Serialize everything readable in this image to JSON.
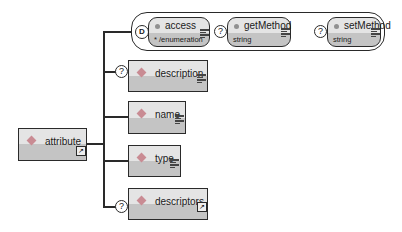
{
  "diagram": {
    "root": {
      "name": "attribute",
      "icon": "expand-icon"
    },
    "choice_group": {
      "symbol": "choice-icon",
      "attributes": [
        {
          "name": "access",
          "type": "* /enumeration",
          "optional": false,
          "icon": "lines-icon"
        },
        {
          "name": "getMethod",
          "type": "string",
          "optional": true,
          "optional_marker": "?",
          "icon": "lines-icon"
        },
        {
          "name": "setMethod",
          "type": "string",
          "optional": true,
          "optional_marker": "?",
          "icon": "lines-icon"
        }
      ]
    },
    "children": [
      {
        "name": "description",
        "optional": true,
        "optional_marker": "?",
        "icon": "lines-icon"
      },
      {
        "name": "name",
        "optional": false,
        "icon": "lines-icon"
      },
      {
        "name": "type",
        "optional": false,
        "icon": "lines-icon"
      },
      {
        "name": "descriptors",
        "optional": true,
        "optional_marker": "?",
        "icon": "expand-icon"
      }
    ],
    "colors": {
      "box_top": "#e4e4e4",
      "box_bottom": "#c4c4c4",
      "diamond": "#c98b93",
      "line": "#2a2a2a"
    }
  }
}
